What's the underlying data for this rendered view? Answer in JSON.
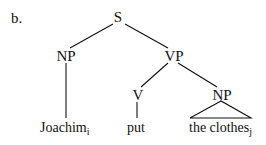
{
  "example_label": "b.",
  "tree": {
    "root": "S",
    "nodes": {
      "s": "S",
      "np_subject": "NP",
      "vp": "VP",
      "v": "V",
      "np_object": "NP"
    },
    "leaves": {
      "subject": {
        "text": "Joachim",
        "index": "i"
      },
      "verb": {
        "text": "put"
      },
      "object": {
        "text": "the clothes",
        "index": "j"
      }
    }
  }
}
